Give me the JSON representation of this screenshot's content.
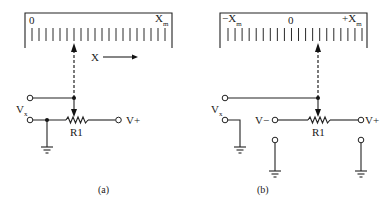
{
  "figure": {
    "panels": [
      {
        "id": "a",
        "caption": "(a)",
        "scale": {
          "labels": [
            {
              "text": "0",
              "sub": ""
            },
            {
              "text": "X",
              "sub": "m"
            }
          ],
          "tick_count": 20
        },
        "direction_label": "X",
        "input_label": {
          "text": "V",
          "sub": "x"
        },
        "resistor_label": "R1",
        "supply_label": "V+"
      },
      {
        "id": "b",
        "caption": "(b)",
        "scale": {
          "labels": [
            {
              "text": "−X",
              "sub": "m"
            },
            {
              "text": "0",
              "sub": ""
            },
            {
              "text": "+X",
              "sub": "m"
            }
          ],
          "tick_count": 20
        },
        "input_label": {
          "text": "V",
          "sub": "x"
        },
        "resistor_label": "R1",
        "neg_supply_label": "V−",
        "pos_supply_label": "V+"
      }
    ],
    "colors": {
      "ink": "#222222",
      "background": "#ffffff"
    }
  }
}
